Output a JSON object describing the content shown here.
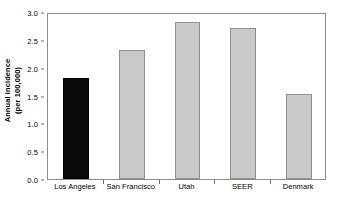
{
  "chart_data": {
    "type": "bar",
    "title": "",
    "xlabel": "",
    "ylabel": "Annual incidence (per 100,000)",
    "ylabel_line1": "Annual incidence",
    "ylabel_line2": "(per 100,000)",
    "categories": [
      "Los Angeles",
      "San Francisco",
      "Utah",
      "SEER",
      "Denmark"
    ],
    "values": [
      1.82,
      2.31,
      2.82,
      2.72,
      1.52
    ],
    "ylim": [
      0.0,
      3.0
    ],
    "yticks": [
      0.0,
      0.5,
      1.0,
      1.5,
      2.0,
      2.5,
      3.0
    ],
    "ytick_labels": [
      "0.0",
      "0.5",
      "1.0",
      "1.5",
      "2.0",
      "2.5",
      "3.0"
    ],
    "grid": false,
    "legend": false,
    "bar_colors": [
      "#0a0a0a",
      "#c9c9c9",
      "#c9c9c9",
      "#c9c9c9",
      "#c9c9c9"
    ],
    "highlight_category": "Los Angeles",
    "series": [
      {
        "name": "Annual incidence",
        "values": [
          1.82,
          2.31,
          2.82,
          2.72,
          1.52
        ]
      }
    ]
  }
}
